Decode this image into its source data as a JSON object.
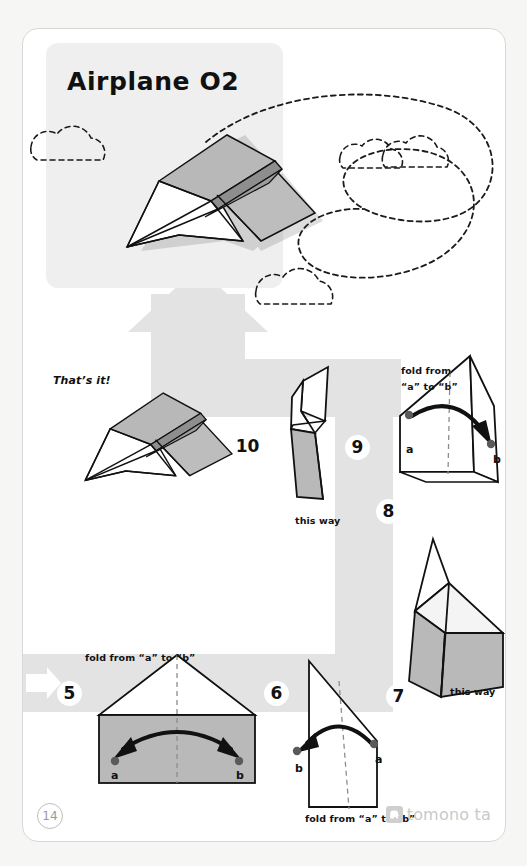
{
  "page": {
    "title": "Airplane O2",
    "page_number": "14",
    "brand": {
      "name": "tomono ta",
      "icon": "elephant-logo-icon"
    }
  },
  "hero": {
    "title": "Airplane O2",
    "subject": "finished-paper-airplane",
    "decorations": [
      "cloud-left",
      "cloud-top-right-pair",
      "cloud-bottom",
      "dashed-flight-path"
    ]
  },
  "flow": {
    "direction_arrow_start": "arrow-right",
    "direction_arrow_end": "arrow-up",
    "band_color": "#e2e2e2",
    "accent_fill": "#b5b5b5"
  },
  "steps": [
    {
      "number": "5",
      "name": "step-5",
      "caption": "fold from “a” to “b”",
      "caption_position": "top",
      "markers": [
        "a",
        "b"
      ],
      "arrow": "double-headed-curved-arrow"
    },
    {
      "number": "6",
      "name": "step-6",
      "caption": "fold from “a” to “b”",
      "caption_position": "bottom",
      "markers": [
        "a",
        "b"
      ],
      "arrow": "curved-arrow-left"
    },
    {
      "number": "7",
      "name": "step-7",
      "caption": "this way",
      "caption_position": "bottom",
      "markers": [],
      "arrow": "none"
    },
    {
      "number": "8",
      "name": "step-8",
      "caption": "fold from\n“a” to “b”",
      "caption_line_1": "fold from",
      "caption_line_2": "“a” to “b”",
      "caption_position": "top",
      "markers": [
        "a",
        "b"
      ],
      "arrow": "curved-arrow-right"
    },
    {
      "number": "9",
      "name": "step-9",
      "caption": "this way",
      "caption_position": "bottom",
      "markers": [],
      "arrow": "none"
    },
    {
      "number": "10",
      "name": "step-10",
      "caption": "That’s it!",
      "caption_position": "left",
      "markers": [],
      "arrow": "none"
    }
  ],
  "result": {
    "label": "That’s it!"
  }
}
